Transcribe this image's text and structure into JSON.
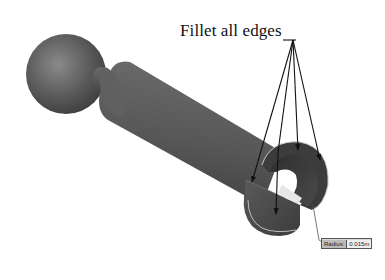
{
  "figure": {
    "callout_text": "Fillet all edges",
    "radius_tag": {
      "label": "Radius:",
      "value": "0.015m"
    },
    "part": {
      "description": "Ball-ended shaft with slotted hollow end (fillet operation)",
      "body_color": "#555555",
      "highlight_color": "#7a7a7a",
      "edge_highlight_color": "#c8c8c8"
    },
    "leader_lines": {
      "origin": [
        293,
        40
      ],
      "targets": [
        [
          252,
          182
        ],
        [
          278,
          135
        ],
        [
          294,
          150
        ],
        [
          316,
          140
        ],
        [
          305,
          250
        ]
      ],
      "count": 5
    }
  }
}
